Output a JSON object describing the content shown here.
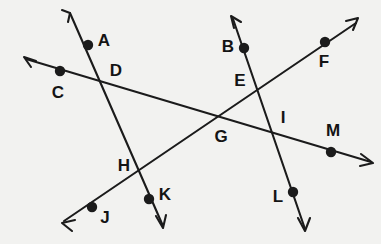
{
  "figure": {
    "type": "geometry-diagram",
    "background_color": "#f2f2f0",
    "stroke_color": "#1b1b1b",
    "label_color": "#141414",
    "width": 381,
    "height": 244,
    "dot_radius": 5.2,
    "lines": [
      {
        "id": "line-A-K",
        "name": "line-through-A-D-H-K",
        "path": "M 70 13 L 163 226",
        "arrow_start": "M 62 10 L 70 13 L 70 13 M 70 13 L 68 22",
        "arrow_end": "M 156 216 L 163 228 L 166 215"
      },
      {
        "id": "line-C-M",
        "name": "line-through-C-D-G-I-M",
        "path": "M 26 59 L 371 162",
        "arrow_start": "M 24 57 L 36 61 M 24 57 L 31 67",
        "arrow_end": "M 361 154 L 373 163 L 360 166"
      },
      {
        "id": "line-B-L",
        "name": "line-through-B-E-I-L",
        "path": "M 233 19 L 305 229",
        "arrow_start": "M 231 16 L 234 28 M 231 16 L 241 22",
        "arrow_end": "M 298 218 L 305 231 L 310 218"
      },
      {
        "id": "line-J-F",
        "name": "line-through-J-H-G-E-F",
        "path": "M 64 221 L 356 23",
        "arrow_start": "M 62 223 L 75 220 M 62 223 L 72 231",
        "arrow_end": "M 346 21 L 358 18 L 353 30"
      }
    ],
    "points": [
      {
        "label": "A",
        "kind": "marked-point",
        "cx": 88,
        "cy": 45,
        "lx": 104,
        "ly": 42,
        "dot": true
      },
      {
        "label": "B",
        "kind": "marked-point",
        "cx": 244,
        "cy": 48,
        "lx": 228,
        "ly": 48,
        "dot": true
      },
      {
        "label": "C",
        "kind": "marked-point",
        "cx": 60,
        "cy": 71,
        "lx": 58,
        "ly": 94,
        "dot": true
      },
      {
        "label": "D",
        "kind": "intersection",
        "cx": 106,
        "cy": 82,
        "lx": 116,
        "ly": 72,
        "dot": false
      },
      {
        "label": "E",
        "kind": "intersection",
        "cx": 257,
        "cy": 87,
        "lx": 240,
        "ly": 82,
        "dot": false
      },
      {
        "label": "F",
        "kind": "marked-point",
        "cx": 325,
        "cy": 42,
        "lx": 324,
        "ly": 63,
        "dot": true
      },
      {
        "label": "G",
        "kind": "intersection",
        "cx": 218,
        "cy": 124,
        "lx": 221,
        "ly": 138,
        "dot": false
      },
      {
        "label": "H",
        "kind": "intersection",
        "cx": 143,
        "cy": 171,
        "lx": 124,
        "ly": 167,
        "dot": false
      },
      {
        "label": "I",
        "kind": "intersection",
        "cx": 273,
        "cy": 134,
        "lx": 283,
        "ly": 119,
        "dot": false
      },
      {
        "label": "J",
        "kind": "marked-point",
        "cx": 92,
        "cy": 207,
        "lx": 105,
        "ly": 219,
        "dot": true
      },
      {
        "label": "K",
        "kind": "marked-point",
        "cx": 149,
        "cy": 199,
        "lx": 165,
        "ly": 196,
        "dot": true
      },
      {
        "label": "L",
        "kind": "marked-point",
        "cx": 293,
        "cy": 192,
        "lx": 278,
        "ly": 198,
        "dot": true
      },
      {
        "label": "M",
        "kind": "marked-point",
        "cx": 331,
        "cy": 152,
        "lx": 333,
        "ly": 132,
        "dot": true
      }
    ]
  }
}
